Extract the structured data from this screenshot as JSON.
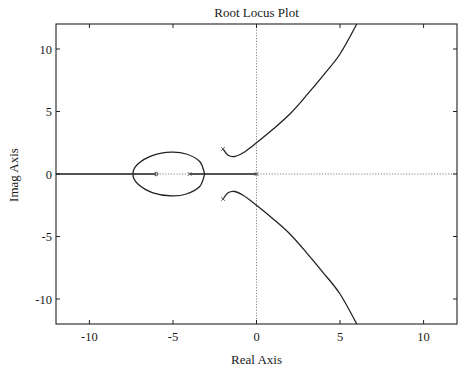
{
  "chart_data": {
    "type": "line",
    "title": "Root Locus Plot",
    "xlabel": "Real Axis",
    "ylabel": "Imag Axis",
    "xlim": [
      -12,
      12
    ],
    "ylim": [
      -12,
      12
    ],
    "xticks": [
      -10,
      -5,
      0,
      5,
      10
    ],
    "yticks": [
      -10,
      -5,
      0,
      5,
      10
    ],
    "xtick_labels": [
      "-10",
      "-5",
      "0",
      "5",
      "10"
    ],
    "ytick_labels": [
      "-10",
      "-5",
      "0",
      "5",
      "10"
    ],
    "grid": false,
    "axis_lines": {
      "real_axis_dotted": true,
      "imag_axis_dotted": true
    },
    "poles": [
      {
        "re": 0,
        "im": 0
      },
      {
        "re": -4,
        "im": 0
      },
      {
        "re": -2,
        "im": 2
      },
      {
        "re": -2,
        "im": -2
      }
    ],
    "zeros": [
      {
        "re": -6,
        "im": 0
      }
    ],
    "series": [
      {
        "name": "upper complex branch",
        "points": [
          [
            -2,
            2
          ],
          [
            -1.7,
            1.5
          ],
          [
            -1.3,
            1.4
          ],
          [
            -0.8,
            1.7
          ],
          [
            0,
            2.5
          ],
          [
            1,
            3.6
          ],
          [
            2,
            4.8
          ],
          [
            3,
            6.3
          ],
          [
            4,
            7.9
          ],
          [
            5,
            9.6
          ],
          [
            6,
            12
          ]
        ]
      },
      {
        "name": "lower complex branch",
        "points": [
          [
            -2,
            -2
          ],
          [
            -1.7,
            -1.5
          ],
          [
            -1.3,
            -1.4
          ],
          [
            -0.8,
            -1.7
          ],
          [
            0,
            -2.5
          ],
          [
            1,
            -3.6
          ],
          [
            2,
            -4.8
          ],
          [
            3,
            -6.3
          ],
          [
            4,
            -7.9
          ],
          [
            5,
            -9.6
          ],
          [
            6,
            -12
          ]
        ]
      },
      {
        "name": "real-axis loop (breakaway/break-in)",
        "points": [
          [
            -3.1,
            0
          ],
          [
            -3.4,
            1.0
          ],
          [
            -4.2,
            1.6
          ],
          [
            -5.1,
            1.75
          ],
          [
            -6.2,
            1.5
          ],
          [
            -7.1,
            0.8
          ],
          [
            -7.4,
            0
          ],
          [
            -7.1,
            -0.8
          ],
          [
            -6.2,
            -1.5
          ],
          [
            -5.1,
            -1.75
          ],
          [
            -4.2,
            -1.6
          ],
          [
            -3.4,
            -1.0
          ],
          [
            -3.1,
            0
          ]
        ]
      },
      {
        "name": "real-axis segments",
        "segments": [
          [
            -12,
            -6
          ],
          [
            -4,
            0
          ]
        ]
      }
    ]
  }
}
